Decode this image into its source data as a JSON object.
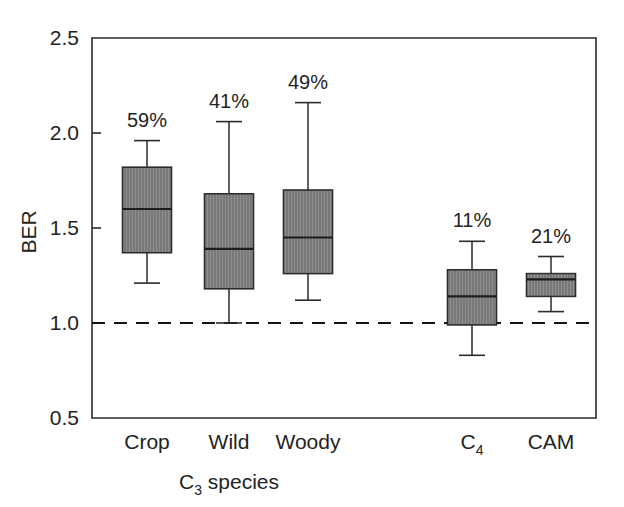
{
  "chart_data": {
    "type": "box",
    "title": "",
    "xlabel": "C3 species",
    "xlabel_base": "C",
    "xlabel_sub": "3",
    "xlabel_tail": " species",
    "ylabel": "BER",
    "ylim": [
      0.5,
      2.5
    ],
    "yticks": [
      "2.5",
      "2.0",
      "1.5",
      "1.0",
      "0.5"
    ],
    "ytick_values": [
      2.5,
      2.0,
      1.5,
      1.0,
      0.5
    ],
    "grid": false,
    "legend": "none",
    "reference_line": {
      "value": 1.0,
      "style": "dashed",
      "label": ""
    },
    "categories": [
      "Crop",
      "Wild",
      "Woody",
      "C4",
      "CAM"
    ],
    "boxes": [
      {
        "category": "Crop",
        "label": "Crop",
        "label_base": "Crop",
        "label_sub": "",
        "group": "C3 species",
        "annotation": "59%",
        "whisker_low": 1.21,
        "q1": 1.37,
        "median": 1.6,
        "q3": 1.82,
        "whisker_high": 1.96
      },
      {
        "category": "Wild",
        "label": "Wild",
        "label_base": "Wild",
        "label_sub": "",
        "group": "C3 species",
        "annotation": "41%",
        "whisker_low": 1.0,
        "q1": 1.18,
        "median": 1.39,
        "q3": 1.68,
        "whisker_high": 2.06
      },
      {
        "category": "Woody",
        "label": "Woody",
        "label_base": "Woody",
        "label_sub": "",
        "group": "C3 species",
        "annotation": "49%",
        "whisker_low": 1.12,
        "q1": 1.26,
        "median": 1.45,
        "q3": 1.7,
        "whisker_high": 2.16
      },
      {
        "category": "C4",
        "label": "C4",
        "label_base": "C",
        "label_sub": "4",
        "group": "C4",
        "annotation": "11%",
        "whisker_low": 0.83,
        "q1": 0.99,
        "median": 1.14,
        "q3": 1.28,
        "whisker_high": 1.43
      },
      {
        "category": "CAM",
        "label": "CAM",
        "label_base": "CAM",
        "label_sub": "",
        "group": "CAM",
        "annotation": "21%",
        "whisker_low": 1.06,
        "q1": 1.14,
        "median": 1.23,
        "q3": 1.26,
        "whisker_high": 1.35
      }
    ]
  },
  "style": {
    "box_fill": "#787878",
    "line_color": "#2b2b2b",
    "text_color": "#232323",
    "background": "#ffffff"
  }
}
